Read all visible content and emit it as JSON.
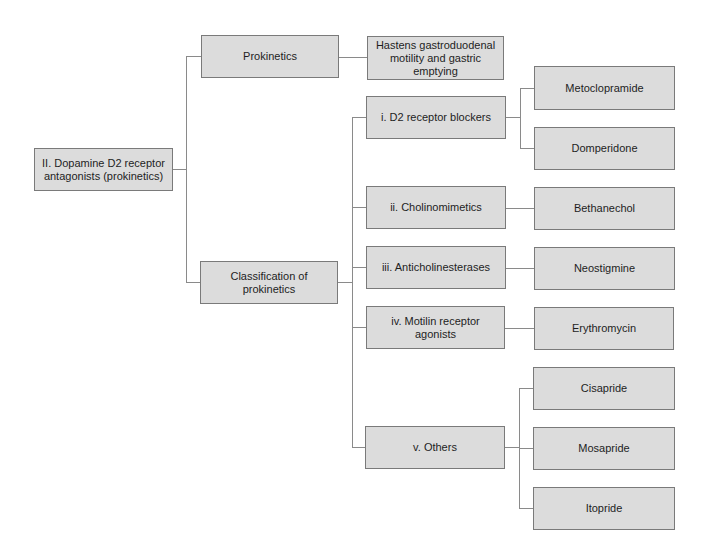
{
  "diagram": {
    "root": {
      "label": "II. Dopamine D2 receptor antagonists (prokinetics)"
    },
    "branches": [
      {
        "label": "Prokinetics",
        "children": [
          {
            "label": "Hastens gastroduodenal motility and gastric emptying"
          }
        ]
      },
      {
        "label": "Classification of prokinetics",
        "children": [
          {
            "label": "i. D2 receptor blockers",
            "drugs": [
              "Metoclopramide",
              "Domperidone"
            ]
          },
          {
            "label": "ii. Cholinomimetics",
            "drugs": [
              "Bethanechol"
            ]
          },
          {
            "label": "iii. Anticholinesterases",
            "drugs": [
              "Neostigmine"
            ]
          },
          {
            "label": "iv. Motilin receptor agonists",
            "drugs": [
              "Erythromycin"
            ]
          },
          {
            "label": "v. Others",
            "drugs": [
              "Cisapride",
              "Mosapride",
              "Itopride"
            ]
          }
        ]
      }
    ]
  },
  "colors": {
    "box_fill": "#dcdcdc",
    "box_border": "#7a7a7a",
    "connector": "#8a8a8a",
    "text": "#1e1e1e"
  }
}
